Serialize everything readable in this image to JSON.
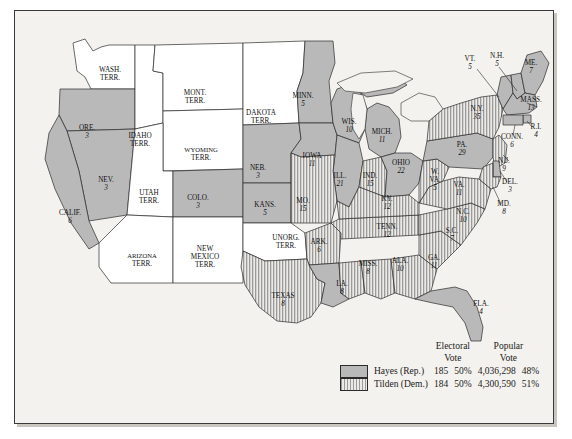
{
  "map": {
    "title": "Election of 1876",
    "background_color": "#f4f2ee",
    "hayes_fill": "#b9b9b9",
    "tilden_fill": "#9a9a9a",
    "territory_fill": "#ffffff",
    "border_color": "#3a3a3a",
    "states": [
      {
        "name": "WASH.",
        "name2": "TERR.",
        "votes": "",
        "party": "territory",
        "x": 95,
        "y": 62
      },
      {
        "name": "ORE.",
        "name2": "",
        "votes": "3",
        "party": "hayes",
        "x": 72,
        "y": 120
      },
      {
        "name": "IDAHO",
        "name2": "TERR.",
        "votes": "",
        "party": "territory",
        "x": 125,
        "y": 128
      },
      {
        "name": "MONT.",
        "name2": "TERR.",
        "votes": "",
        "party": "territory",
        "x": 180,
        "y": 85
      },
      {
        "name": "WYOMING",
        "name2": "TERR.",
        "votes": "",
        "party": "territory",
        "x": 186,
        "y": 142
      },
      {
        "name": "DAKOTA",
        "name2": "TERR.",
        "votes": "",
        "party": "territory",
        "x": 246,
        "y": 105
      },
      {
        "name": "NEV.",
        "name2": "",
        "votes": "3",
        "party": "hayes",
        "x": 91,
        "y": 172
      },
      {
        "name": "CALIF.",
        "name2": "",
        "votes": "6",
        "party": "hayes",
        "x": 55,
        "y": 205
      },
      {
        "name": "UTAH",
        "name2": "TERR.",
        "votes": "",
        "party": "territory",
        "x": 134,
        "y": 185
      },
      {
        "name": "COLO.",
        "name2": "",
        "votes": "3",
        "party": "hayes",
        "x": 183,
        "y": 190
      },
      {
        "name": "ARIZONA",
        "name2": "TERR.",
        "votes": "",
        "party": "territory",
        "x": 127,
        "y": 248
      },
      {
        "name": "NEW",
        "name2": "MEXICO",
        "name3": "TERR.",
        "votes": "",
        "party": "territory",
        "x": 190,
        "y": 245
      },
      {
        "name": "NEB.",
        "name2": "",
        "votes": "3",
        "party": "hayes",
        "x": 243,
        "y": 160
      },
      {
        "name": "KANS.",
        "name2": "",
        "votes": "5",
        "party": "hayes",
        "x": 250,
        "y": 197
      },
      {
        "name": "MINN.",
        "name2": "",
        "votes": "5",
        "party": "hayes",
        "x": 288,
        "y": 88
      },
      {
        "name": "IOWA",
        "name2": "",
        "votes": "11",
        "party": "hayes",
        "x": 297,
        "y": 148
      },
      {
        "name": "WIS.",
        "name2": "",
        "votes": "10",
        "party": "hayes",
        "x": 334,
        "y": 114
      },
      {
        "name": "MICH.",
        "name2": "",
        "votes": "11",
        "party": "hayes",
        "x": 367,
        "y": 124
      },
      {
        "name": "ILL.",
        "name2": "",
        "votes": "21",
        "party": "hayes",
        "x": 325,
        "y": 168
      },
      {
        "name": "IND.",
        "name2": "",
        "votes": "15",
        "party": "tilden",
        "x": 355,
        "y": 168
      },
      {
        "name": "OHIO",
        "name2": "",
        "votes": "22",
        "party": "hayes",
        "x": 386,
        "y": 155
      },
      {
        "name": "MO.",
        "name2": "",
        "votes": "15",
        "party": "tilden",
        "x": 288,
        "y": 193
      },
      {
        "name": "UNORG.",
        "name2": "TERR.",
        "votes": "",
        "party": "territory",
        "x": 271,
        "y": 230
      },
      {
        "name": "ARK.",
        "name2": "",
        "votes": "6",
        "party": "tilden",
        "x": 304,
        "y": 234
      },
      {
        "name": "TEXAS",
        "name2": "",
        "votes": "8",
        "party": "tilden",
        "x": 268,
        "y": 288
      },
      {
        "name": "LA.",
        "name2": "",
        "votes": "8",
        "party": "hayes",
        "x": 327,
        "y": 276
      },
      {
        "name": "MISS.",
        "name2": "",
        "votes": "8",
        "party": "tilden",
        "x": 353,
        "y": 256
      },
      {
        "name": "ALA.",
        "name2": "",
        "votes": "10",
        "party": "tilden",
        "x": 385,
        "y": 253
      },
      {
        "name": "GA.",
        "name2": "",
        "votes": "11",
        "party": "tilden",
        "x": 419,
        "y": 250
      },
      {
        "name": "FLA.",
        "name2": "",
        "votes": "4",
        "party": "hayes",
        "x": 466,
        "y": 296
      },
      {
        "name": "TENN.",
        "name2": "",
        "votes": "12",
        "party": "tilden",
        "x": 372,
        "y": 219
      },
      {
        "name": "KY.",
        "name2": "",
        "votes": "12",
        "party": "tilden",
        "x": 372,
        "y": 191
      },
      {
        "name": "S.C.",
        "name2": "",
        "votes": "7",
        "party": "tilden",
        "x": 437,
        "y": 223
      },
      {
        "name": "N.C.",
        "name2": "",
        "votes": "10",
        "party": "tilden",
        "x": 448,
        "y": 204
      },
      {
        "name": "VA.",
        "name2": "",
        "votes": "11",
        "party": "tilden",
        "x": 444,
        "y": 177
      },
      {
        "name": "W.",
        "name2": "VA.",
        "votes": "5",
        "party": "tilden",
        "x": 420,
        "y": 168
      },
      {
        "name": "PA.",
        "name2": "",
        "votes": "29",
        "party": "hayes",
        "x": 447,
        "y": 137
      },
      {
        "name": "N.Y.",
        "name2": "",
        "votes": "35",
        "party": "tilden",
        "x": 462,
        "y": 101
      },
      {
        "name": "VT.",
        "name2": "",
        "votes": "5",
        "party": "hayes",
        "x": 455,
        "y": 51
      },
      {
        "name": "N.H.",
        "name2": "",
        "votes": "5",
        "party": "hayes",
        "x": 482,
        "y": 48
      },
      {
        "name": "ME.",
        "name2": "",
        "votes": "7",
        "party": "hayes",
        "x": 516,
        "y": 55
      },
      {
        "name": "MASS.",
        "name2": "",
        "votes": "13",
        "party": "hayes",
        "x": 516,
        "y": 92
      },
      {
        "name": "R.I.",
        "name2": "",
        "votes": "4",
        "party": "hayes",
        "x": 521,
        "y": 119
      },
      {
        "name": "CONN.",
        "name2": "",
        "votes": "6",
        "party": "hayes",
        "x": 497,
        "y": 129
      },
      {
        "name": "N.J.",
        "name2": "",
        "votes": "9",
        "party": "tilden",
        "x": 489,
        "y": 153
      },
      {
        "name": "DEL.",
        "name2": "",
        "votes": "3",
        "party": "hayes",
        "x": 495,
        "y": 174
      },
      {
        "name": "MD.",
        "name2": "",
        "votes": "8",
        "party": "tilden",
        "x": 489,
        "y": 196
      }
    ]
  },
  "legend": {
    "headers": {
      "electoral_line1": "Electoral",
      "electoral_line2": "Vote",
      "popular_line1": "Popular",
      "popular_line2": "Vote"
    },
    "rows": [
      {
        "candidate": "Hayes (Rep.)",
        "swatch": "solid-gray-swatch",
        "electoral_votes": "185",
        "electoral_pct": "50%",
        "popular_votes": "4,036,298",
        "popular_pct": "48%"
      },
      {
        "candidate": "Tilden (Dem.)",
        "swatch": "striped-swatch",
        "electoral_votes": "184",
        "electoral_pct": "50%",
        "popular_votes": "4,300,590",
        "popular_pct": "51%"
      }
    ]
  }
}
